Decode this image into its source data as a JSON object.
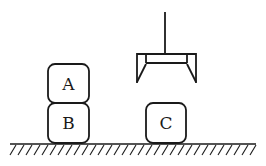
{
  "diagram": {
    "colors": {
      "ink": "#1a1a1a",
      "background": "#ffffff"
    },
    "blocks": [
      {
        "label": "A",
        "x": 48,
        "y": 64,
        "w": 41,
        "h": 39,
        "on": "B"
      },
      {
        "label": "B",
        "x": 48,
        "y": 103,
        "w": 41,
        "h": 40,
        "on": "table"
      },
      {
        "label": "C",
        "x": 146,
        "y": 103,
        "w": 40,
        "h": 40,
        "on": "table"
      }
    ],
    "gripper": {
      "state": "open",
      "empty": true
    },
    "table": {
      "label": "ground"
    }
  }
}
